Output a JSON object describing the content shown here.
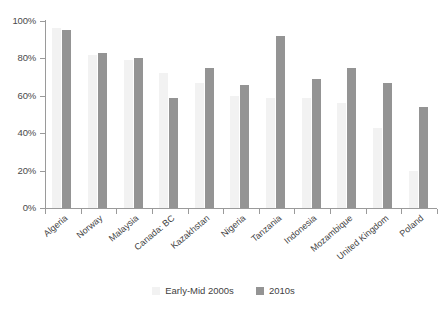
{
  "chart_data": {
    "type": "bar",
    "title": "",
    "xlabel": "",
    "ylabel": "",
    "ylim": [
      0,
      100
    ],
    "ytick_labels": [
      "0%",
      "20%",
      "40%",
      "60%",
      "80%",
      "100%"
    ],
    "ytick_values": [
      0,
      20,
      40,
      60,
      80,
      100
    ],
    "grid": false,
    "legend_position": "bottom-center",
    "categories": [
      "Algeria",
      "Norway",
      "Malaysia",
      "Canada: BC",
      "Kazakhstan",
      "Nigeria",
      "Tanzania",
      "Indonesia",
      "Mozambique",
      "United Kingdom",
      "Poland"
    ],
    "series": [
      {
        "name": "Early-Mid 2000s",
        "color": "#f2f2f2",
        "values": [
          96,
          82,
          79,
          72,
          67,
          60,
          59,
          59,
          56,
          43,
          20
        ]
      },
      {
        "name": "2010s",
        "color": "#949494",
        "values": [
          95,
          83,
          80,
          59,
          75,
          66,
          92,
          69,
          75,
          67,
          54
        ]
      }
    ]
  },
  "legend": {
    "items": [
      {
        "label": "Early-Mid 2000s",
        "swatch": "light"
      },
      {
        "label": "2010s",
        "swatch": "dark"
      }
    ]
  }
}
